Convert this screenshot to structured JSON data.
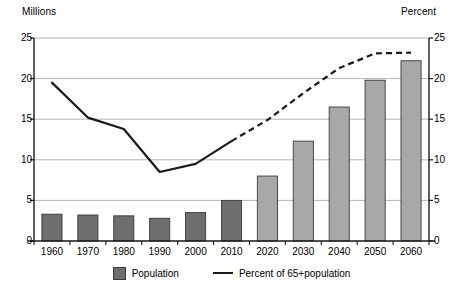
{
  "chart_data": {
    "type": "bar",
    "title": "",
    "categories": [
      "1960",
      "1970",
      "1980",
      "1990",
      "2000",
      "2010",
      "2020",
      "2030",
      "2040",
      "2050",
      "2060"
    ],
    "series": [
      {
        "name": "Population",
        "unit": "Millions",
        "axis": "left",
        "values": [
          3.3,
          3.2,
          3.1,
          2.8,
          3.5,
          5.0,
          8.0,
          12.3,
          16.5,
          19.8,
          22.2
        ],
        "estimated_from": [
          "1960",
          "1970",
          "1980",
          "1990",
          "2000",
          "2010"
        ],
        "projected_from": [
          "2020",
          "2030",
          "2040",
          "2050",
          "2060"
        ]
      },
      {
        "name": "Percent of 65+population",
        "unit": "Percent",
        "axis": "right",
        "type": "line",
        "values": [
          19.5,
          15.2,
          13.8,
          8.5,
          9.5,
          12.3,
          14.9,
          18.2,
          21.3,
          23.1,
          23.2
        ],
        "solid_through": "2010",
        "dashed_from": "2010"
      }
    ],
    "xlabel": "",
    "ylabel": "Millions",
    "y2label": "Percent",
    "ylim": [
      0,
      25
    ],
    "y2lim": [
      0,
      25
    ],
    "yticks": [
      0,
      5,
      10,
      15,
      20,
      25
    ],
    "y2ticks": [
      0,
      5,
      10,
      15,
      20,
      25
    ],
    "grid": true,
    "legend_position": "bottom"
  },
  "axes": {
    "left_title": "Millions",
    "right_title": "Percent",
    "left_ticks": [
      "25",
      "20",
      "15",
      "10",
      "5",
      "0"
    ],
    "right_ticks": [
      "25",
      "20",
      "15",
      "10",
      "5",
      "0"
    ],
    "x_ticks": [
      "1960",
      "1970",
      "1980",
      "1990",
      "2000",
      "2010",
      "2020",
      "2030",
      "2040",
      "2050",
      "2060"
    ]
  },
  "legend": {
    "bar_label": "Population",
    "line_label": "Percent of 65+population"
  },
  "colors": {
    "bar_dark": "#6e6e6e",
    "bar_light": "#a8a8a8",
    "bar_edge": "#3a3a3a",
    "line": "#1a1a1a",
    "grid": "#b5b5b5",
    "axis": "#1a1a1a"
  }
}
